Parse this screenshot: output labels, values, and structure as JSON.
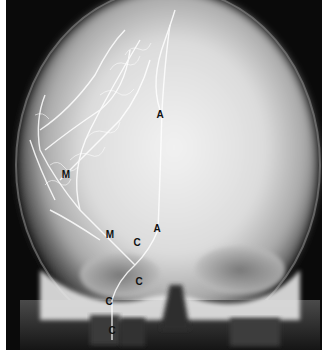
{
  "image": {
    "description": "Frontal cerebral angiogram X-ray of skull with labeled arteries",
    "background_color": "#0a0a0a",
    "border_color": "#ffffff"
  },
  "labels": [
    {
      "text": "A",
      "x": 160,
      "y": 115
    },
    {
      "text": "M",
      "x": 66,
      "y": 175
    },
    {
      "text": "M",
      "x": 110,
      "y": 235
    },
    {
      "text": "C",
      "x": 137,
      "y": 243
    },
    {
      "text": "A",
      "x": 157,
      "y": 229
    },
    {
      "text": "C",
      "x": 139,
      "y": 282
    },
    {
      "text": "C",
      "x": 109,
      "y": 302
    },
    {
      "text": "C",
      "x": 112,
      "y": 331
    }
  ]
}
